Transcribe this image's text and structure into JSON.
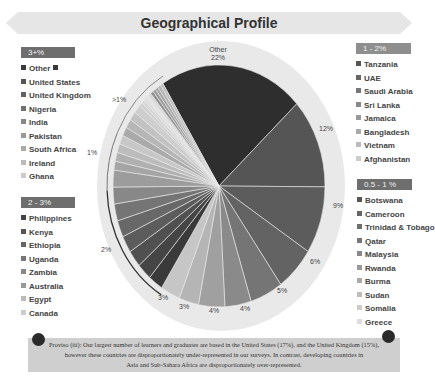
{
  "title": "Geographical Profile",
  "legends": {
    "group_3plus": {
      "header": "3+%",
      "items": [
        {
          "label": "Other",
          "color": "#3a3a3a",
          "trailing_swatch": true
        },
        {
          "label": "United States",
          "color": "#555555"
        },
        {
          "label": "United Kingdom",
          "color": "#606060"
        },
        {
          "label": "Nigeria",
          "color": "#707070"
        },
        {
          "label": "India",
          "color": "#888888"
        },
        {
          "label": "Pakistan",
          "color": "#999999"
        },
        {
          "label": "South Africa",
          "color": "#aaaaaa"
        },
        {
          "label": "Ireland",
          "color": "#bbbbbb"
        },
        {
          "label": "Ghana",
          "color": "#cccccc"
        }
      ]
    },
    "group_2_3": {
      "header": "2 - 3%",
      "items": [
        {
          "label": "Philippines",
          "color": "#444444"
        },
        {
          "label": "Kenya",
          "color": "#555555"
        },
        {
          "label": "Ethiopia",
          "color": "#666666"
        },
        {
          "label": "Uganda",
          "color": "#777777"
        },
        {
          "label": "Zambia",
          "color": "#888888"
        },
        {
          "label": "Australia",
          "color": "#999999"
        },
        {
          "label": "Egypt",
          "color": "#bbbbbb"
        },
        {
          "label": "Canada",
          "color": "#cccccc"
        }
      ]
    },
    "group_1_2": {
      "header": "1 - 2%",
      "items": [
        {
          "label": "Tanzania",
          "color": "#555555"
        },
        {
          "label": "UAE",
          "color": "#666666"
        },
        {
          "label": "Saudi Arabia",
          "color": "#777777"
        },
        {
          "label": "Sri Lanka",
          "color": "#888888"
        },
        {
          "label": "Jamaica",
          "color": "#999999"
        },
        {
          "label": "Bangladesh",
          "color": "#aaaaaa"
        },
        {
          "label": "Vietnam",
          "color": "#bbbbbb"
        },
        {
          "label": "Afghanistan",
          "color": "#cccccc"
        }
      ]
    },
    "group_05_1": {
      "header": "0.5 - 1 %",
      "items": [
        {
          "label": "Botswana",
          "color": "#555555"
        },
        {
          "label": "Cameroon",
          "color": "#666666"
        },
        {
          "label": "Trinidad & Tobago",
          "color": "#6e6e6e"
        },
        {
          "label": "Qatar",
          "color": "#777777"
        },
        {
          "label": "Malaysia",
          "color": "#888888"
        },
        {
          "label": "Rwanda",
          "color": "#999999"
        },
        {
          "label": "Burma",
          "color": "#aaaaaa"
        },
        {
          "label": "Sudan",
          "color": "#bbbbbb"
        },
        {
          "label": "Somalia",
          "color": "#cccccc"
        },
        {
          "label": "Greece",
          "color": "#dddddd"
        }
      ]
    }
  },
  "pie_labels": {
    "other_name": "Other",
    "other_pct": "22%",
    "l12": "12%",
    "l9": "9%",
    "l6": "6%",
    "l5": "5%",
    "l4a": "4%",
    "l4b": "4%",
    "l3a": "3%",
    "l3b": "3%",
    "group_2": "2%",
    "group_1": "1%",
    "group_lt1": ">1%"
  },
  "note": {
    "line1": "Proviso (iii): Our largest number of learners and graduates are based in the United States (17%), and the United Kingdom (15%),",
    "line2": "however these countries are disproportionately under-represented in our surveys.  In contrast, developing countries in",
    "line3": "Asia and Sub-Sahara Africa are disproportionately over-represented."
  },
  "chart_data": {
    "type": "pie",
    "title": "Geographical Profile",
    "categories": [
      "Other",
      "United States",
      "United Kingdom",
      "Nigeria",
      "India",
      "Pakistan",
      "South Africa",
      "Ireland",
      "Ghana",
      "2-3% group (8 countries)",
      "1-2% group (8 countries)",
      "0.5-1% group (10 countries)"
    ],
    "values": [
      22,
      12,
      9,
      6,
      5,
      4,
      4,
      3,
      3,
      2,
      1,
      0.5
    ],
    "labeled_slices": [
      {
        "label": "Other",
        "value": 22
      },
      {
        "label": "United States",
        "value": 12
      },
      {
        "label": "United Kingdom",
        "value": 9
      },
      {
        "label": "Nigeria",
        "value": 6
      },
      {
        "label": "India",
        "value": 5
      },
      {
        "label": "Pakistan",
        "value": 4
      },
      {
        "label": "South Africa",
        "value": 4
      },
      {
        "label": "Ireland",
        "value": 3
      },
      {
        "label": "Ghana",
        "value": 3
      }
    ],
    "group_labels": [
      {
        "range": "2 - 3%",
        "arc_label": "2%",
        "countries": [
          "Philippines",
          "Kenya",
          "Ethiopia",
          "Uganda",
          "Zambia",
          "Australia",
          "Egypt",
          "Canada"
        ]
      },
      {
        "range": "1 - 2%",
        "arc_label": "1%",
        "countries": [
          "Tanzania",
          "UAE",
          "Saudi Arabia",
          "Sri Lanka",
          "Jamaica",
          "Bangladesh",
          "Vietnam",
          "Afghanistan"
        ]
      },
      {
        "range": "0.5 - 1 %",
        "arc_label": ">1%",
        "countries": [
          "Botswana",
          "Cameroon",
          "Trinidad & Tobago",
          "Qatar",
          "Malaysia",
          "Rwanda",
          "Burma",
          "Sudan",
          "Somalia",
          "Greece"
        ]
      }
    ],
    "legend_position": "sides"
  }
}
